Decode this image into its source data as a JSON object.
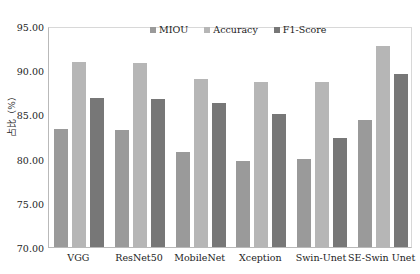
{
  "chart_data": {
    "type": "bar",
    "title": "",
    "xlabel": "",
    "ylabel": "占比（%）",
    "ylim": [
      70.0,
      95.0
    ],
    "ytick_step": 5.0,
    "ytick_labels": [
      "95.00",
      "90.00",
      "85.00",
      "80.00",
      "75.00",
      "70.00"
    ],
    "ytick_values": [
      95.0,
      90.0,
      85.0,
      80.0,
      75.0,
      70.0
    ],
    "grid": false,
    "legend_position": "top-center",
    "categories": [
      "VGG",
      "ResNet50",
      "MobileNet",
      "Xception",
      "Swin-Unet",
      "SE-Swin Unet"
    ],
    "series": [
      {
        "name": "MIOU",
        "color": "#9a9a9a",
        "values": [
          83.3,
          83.2,
          80.8,
          79.7,
          79.9,
          84.4
        ]
      },
      {
        "name": "Accuracy",
        "color": "#b6b6b6",
        "values": [
          90.9,
          90.8,
          89.0,
          88.7,
          88.7,
          92.7
        ]
      },
      {
        "name": "F1-Score",
        "color": "#777777",
        "values": [
          86.9,
          86.8,
          86.3,
          85.1,
          82.3,
          89.6
        ]
      }
    ]
  },
  "legend": {
    "items": [
      {
        "label": "MIOU",
        "color": "#9a9a9a"
      },
      {
        "label": "Accuracy",
        "color": "#b6b6b6"
      },
      {
        "label": "F1-Score",
        "color": "#777777"
      }
    ]
  },
  "axes": {
    "y_label": "占比（%）"
  }
}
